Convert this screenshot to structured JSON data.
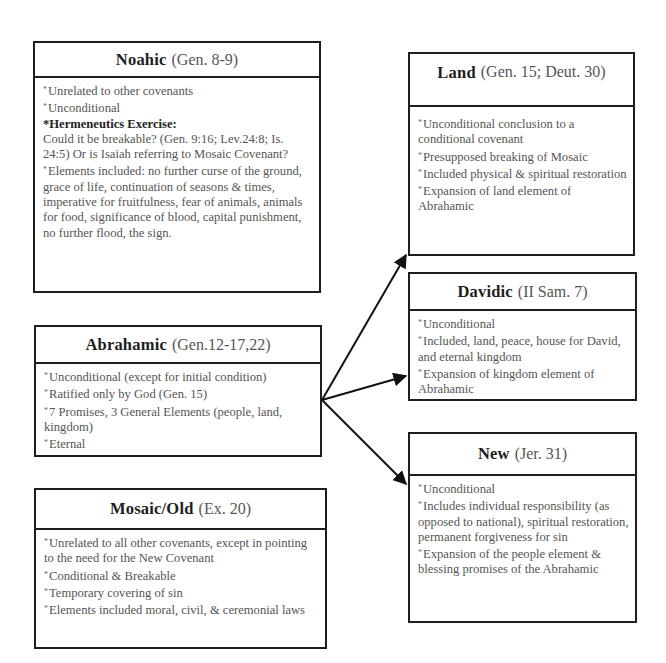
{
  "diagram": {
    "covenants": {
      "noahic": {
        "name": "Noahic",
        "ref": "(Gen. 8-9)",
        "lines": [
          {
            "bullet": true,
            "text": "Unrelated to other covenants"
          },
          {
            "bullet": true,
            "text": "Unconditional"
          },
          {
            "bullet": false,
            "strong": true,
            "text": "*Hermeneutics Exercise:"
          },
          {
            "bullet": false,
            "text": "Could it be breakable? (Gen. 9:16; Lev.24:8; Is. 24:5) Or is Isaiah referring to Mosaic Covenant?"
          },
          {
            "bullet": true,
            "text": "Elements included: no further curse of the ground, grace of life, continuation of seasons & times, imperative for fruitfulness, fear of animals, animals for food, significance of blood, capital punishment, no further flood, the sign."
          }
        ]
      },
      "abrahamic": {
        "name": "Abrahamic",
        "ref": "(Gen.12-17,22)",
        "lines": [
          {
            "bullet": true,
            "text": "Unconditional (except for initial condition)"
          },
          {
            "bullet": true,
            "text": "Ratified only by God (Gen. 15)"
          },
          {
            "bullet": true,
            "text": "7 Promises, 3 General Elements (people, land, kingdom)"
          },
          {
            "bullet": true,
            "text": "Eternal"
          }
        ]
      },
      "mosaic": {
        "name": "Mosaic/Old",
        "ref": "(Ex. 20)",
        "lines": [
          {
            "bullet": true,
            "text": "Unrelated to all other covenants, except in pointing to the need for the New Covenant"
          },
          {
            "bullet": true,
            "text": "Conditional & Breakable"
          },
          {
            "bullet": true,
            "text": "Temporary covering of sin"
          },
          {
            "bullet": true,
            "text": "Elements included moral, civil, & ceremonial laws"
          }
        ]
      },
      "land": {
        "name": "Land",
        "ref": "(Gen. 15; Deut. 30)",
        "lines": [
          {
            "bullet": true,
            "text": "Unconditional conclusion to a conditional covenant"
          },
          {
            "bullet": true,
            "text": "Presupposed breaking of Mosaic"
          },
          {
            "bullet": true,
            "text": "Included physical & spiritual restoration"
          },
          {
            "bullet": true,
            "text": "Expansion of land element of Abrahamic"
          }
        ]
      },
      "davidic": {
        "name": "Davidic",
        "ref": "(II Sam. 7)",
        "lines": [
          {
            "bullet": true,
            "text": "Unconditional"
          },
          {
            "bullet": true,
            "text": "Included, land, peace, house for David, and eternal kingdom"
          },
          {
            "bullet": true,
            "text": "Expansion of kingdom element of Abrahamic"
          }
        ]
      },
      "new": {
        "name": "New",
        "ref": "(Jer. 31)",
        "lines": [
          {
            "bullet": true,
            "text": "Unconditional"
          },
          {
            "bullet": true,
            "text": "Includes individual responsibility (as opposed to national), spiritual restoration, permanent forgiveness for sin"
          },
          {
            "bullet": true,
            "text": "Expansion of the people element & blessing promises of the Abrahamic"
          }
        ]
      }
    },
    "edges": [
      {
        "from": "abrahamic",
        "to": "land"
      },
      {
        "from": "abrahamic",
        "to": "davidic"
      },
      {
        "from": "abrahamic",
        "to": "new"
      }
    ],
    "colors": {
      "border": "#1e1e1e",
      "heading": "#1e1e1e",
      "text": "#555555"
    }
  }
}
